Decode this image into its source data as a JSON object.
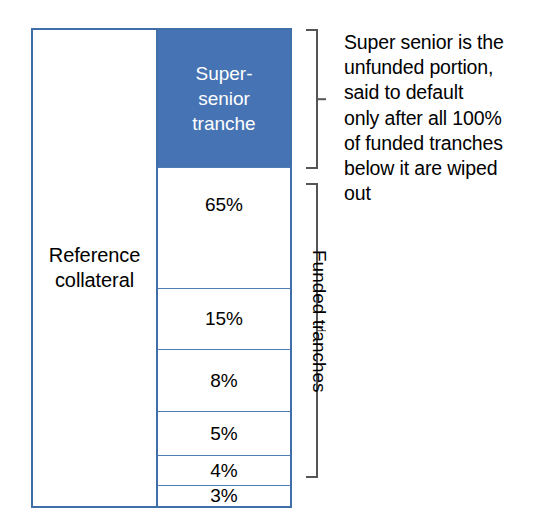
{
  "diagram": {
    "colors": {
      "tranche_blue": "#4673b4",
      "border_blue": "#3f6ea8",
      "divider_blue": "#4f7cb4",
      "bracket_gray": "#555555",
      "text_black": "#000000",
      "super_text_white": "#ffffff",
      "background": "#ffffff"
    },
    "collateral": {
      "label": "Reference\ncollateral"
    },
    "tranches": [
      {
        "id": "super-senior",
        "label": "Super-\nsenior\ntranche",
        "value": null,
        "funded": false,
        "filled": true
      },
      {
        "id": "tranche-65",
        "label": "65%",
        "value": 65,
        "funded": true,
        "filled": false
      },
      {
        "id": "tranche-15",
        "label": "15%",
        "value": 15,
        "funded": true,
        "filled": false
      },
      {
        "id": "tranche-8",
        "label": "8%",
        "value": 8,
        "funded": true,
        "filled": false
      },
      {
        "id": "tranche-5",
        "label": "5%",
        "value": 5,
        "funded": true,
        "filled": false
      },
      {
        "id": "tranche-4",
        "label": "4%",
        "value": 4,
        "funded": true,
        "filled": false
      },
      {
        "id": "tranche-3",
        "label": "3%",
        "value": 3,
        "funded": true,
        "filled": false
      }
    ],
    "brackets": {
      "super_senior": {
        "annotation": "Super senior is the\nunfunded portion,\nsaid to default\nonly after all 100%\nof funded tranches\nbelow it are wiped\nout"
      },
      "funded": {
        "label": "Funded tranches"
      }
    }
  }
}
